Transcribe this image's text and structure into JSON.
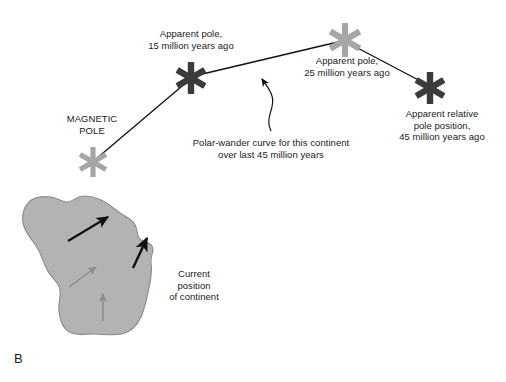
{
  "figure": {
    "panel_letter": "B",
    "background_color": "#ffffff",
    "dark_marker_color": "#3b3b3b",
    "light_marker_color": "#a6a6a6",
    "continent_fill_color": "#b3b3b3",
    "continent_outline_color": "#7a7a7a",
    "line_color": "#1a1a1a"
  },
  "labels": {
    "magnetic_pole": "MAGNETIC\nPOLE",
    "apparent_pole_15": "Apparent pole,\n15 million years ago",
    "apparent_pole_25": "Apparent pole,\n25 million years ago",
    "apparent_pole_45": "Apparent relative\npole position,\n45 million years ago",
    "polar_wander_caption": "Polar-wander curve for this continent\nover last 45 million years",
    "current_position": "Current\nposition\nof continent"
  },
  "markers": [
    {
      "name": "magnetic-pole-star",
      "x": 93,
      "y": 162,
      "color": "light",
      "radius": 15
    },
    {
      "name": "apparent-pole-15ma-star",
      "x": 191,
      "y": 78,
      "color": "dark",
      "radius": 16
    },
    {
      "name": "apparent-pole-25ma-star",
      "x": 345,
      "y": 40,
      "color": "light",
      "radius": 17
    },
    {
      "name": "apparent-pole-45ma-star",
      "x": 430,
      "y": 88,
      "color": "dark",
      "radius": 16
    }
  ],
  "polar_wander_path": [
    {
      "x": 93,
      "y": 162
    },
    {
      "x": 191,
      "y": 78
    },
    {
      "x": 345,
      "y": 40
    },
    {
      "x": 430,
      "y": 88
    }
  ],
  "continent_arrows": [
    {
      "name": "continent-arrow-upper-left",
      "tone": "dark",
      "x1": 68,
      "y1": 241,
      "x2": 110,
      "y2": 216
    },
    {
      "name": "continent-arrow-upper-right",
      "tone": "dark",
      "x1": 133,
      "y1": 267,
      "x2": 148,
      "y2": 237
    },
    {
      "name": "continent-arrow-middle",
      "tone": "gray",
      "x1": 69,
      "y1": 286,
      "x2": 97,
      "y2": 266
    },
    {
      "name": "continent-arrow-lower",
      "tone": "gray",
      "x1": 103,
      "y1": 320,
      "x2": 103,
      "y2": 293
    }
  ]
}
